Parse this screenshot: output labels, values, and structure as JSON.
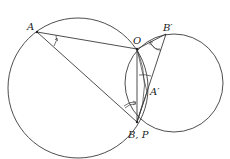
{
  "diagram": {
    "type": "geometry",
    "stroke_color": "#3a3a3a",
    "points": {
      "A": {
        "label": "A",
        "x": 37,
        "y": 32
      },
      "O": {
        "label": "O",
        "x": 137,
        "y": 49
      },
      "B_prime": {
        "label": "B′",
        "x": 166,
        "y": 34
      },
      "A_prime": {
        "label": "A′",
        "x": 147,
        "y": 92
      },
      "BP": {
        "label": "B, P",
        "x": 137,
        "y": 122
      }
    },
    "circles": [
      {
        "name": "left-circle",
        "cx": 78,
        "cy": 88,
        "r": 70
      },
      {
        "name": "right-circle",
        "cx": 174,
        "cy": 83,
        "r": 49
      }
    ],
    "segments": [
      [
        "A",
        "O"
      ],
      [
        "A",
        "BP"
      ],
      [
        "O",
        "BP"
      ],
      [
        "O",
        "B_prime"
      ],
      [
        "B_prime",
        "BP"
      ],
      [
        "O",
        "A_prime"
      ]
    ],
    "labels": {
      "A": "A",
      "O": "O",
      "B_prime": "B′",
      "A_prime": "A′",
      "BP": "B, P"
    }
  }
}
